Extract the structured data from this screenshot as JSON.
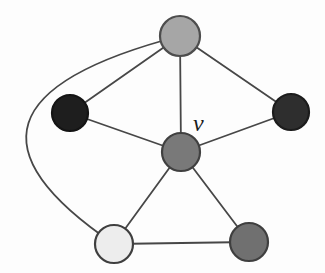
{
  "figure": {
    "type": "graph",
    "background": "#fdfdfd",
    "edge_color": "#474747",
    "edge_width": 1.8,
    "node_stroke_width": 2.2,
    "label": {
      "text": "v",
      "x": 193,
      "y": 131,
      "font_size": 24,
      "color": "#1a1a1a"
    },
    "nodes": [
      {
        "id": "top",
        "x": 180,
        "y": 36,
        "r": 20,
        "fill": "#a6a6a6",
        "stroke": "#4d4d4d"
      },
      {
        "id": "left",
        "x": 70,
        "y": 113,
        "r": 18,
        "fill": "#1e1e1e",
        "stroke": "#141414"
      },
      {
        "id": "right",
        "x": 291,
        "y": 112,
        "r": 18,
        "fill": "#2e2e2e",
        "stroke": "#1c1c1c"
      },
      {
        "id": "center",
        "x": 181,
        "y": 152,
        "r": 19,
        "fill": "#797979",
        "stroke": "#404040"
      },
      {
        "id": "bottom-left",
        "x": 114,
        "y": 244,
        "r": 19,
        "fill": "#ededed",
        "stroke": "#3f3f3f"
      },
      {
        "id": "bottom-right",
        "x": 249,
        "y": 242,
        "r": 19,
        "fill": "#707070",
        "stroke": "#3f3f3f"
      }
    ],
    "edges": [
      {
        "from": "top",
        "to": "left"
      },
      {
        "from": "top",
        "to": "center"
      },
      {
        "from": "top",
        "to": "right"
      },
      {
        "from": "top",
        "to": "bottom-left",
        "control": [
          -90,
          106
        ]
      },
      {
        "from": "left",
        "to": "center"
      },
      {
        "from": "right",
        "to": "center"
      },
      {
        "from": "center",
        "to": "bottom-left"
      },
      {
        "from": "center",
        "to": "bottom-right"
      },
      {
        "from": "bottom-left",
        "to": "bottom-right"
      }
    ]
  }
}
